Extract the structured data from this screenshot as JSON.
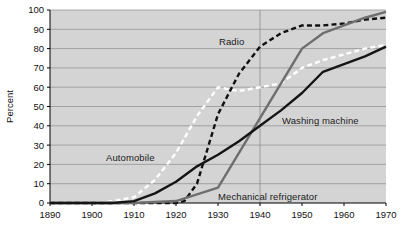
{
  "chart_data": {
    "type": "line",
    "title": "",
    "subtitle": "",
    "xlabel": "",
    "ylabel": "Percent",
    "xlim": [
      1890,
      1970
    ],
    "ylim": [
      0,
      100
    ],
    "grid": "horizontal-and-vertical",
    "legend_position": "inline-annotations",
    "plot_background": "#d4d4d4",
    "x_ticks": [
      1890,
      1900,
      1910,
      1920,
      1930,
      1940,
      1950,
      1960,
      1970
    ],
    "x_tick_labels": [
      "1890",
      "1900",
      "1910",
      "1920",
      "1930",
      "1940",
      "1950",
      "1960",
      "1970"
    ],
    "y_ticks": [
      0,
      10,
      20,
      30,
      40,
      50,
      60,
      70,
      80,
      90,
      100
    ],
    "y_tick_labels": [
      "0",
      "10",
      "20",
      "30",
      "40",
      "50",
      "60",
      "70",
      "80",
      "90",
      "100"
    ],
    "vertical_gridline_emphasis": 1940,
    "series": [
      {
        "name": "Automobile",
        "label": "Automobile",
        "color": "#ffffff",
        "style": "dashed",
        "x": [
          1890,
          1900,
          1905,
          1910,
          1915,
          1920,
          1925,
          1930,
          1935,
          1940,
          1945,
          1950,
          1955,
          1960,
          1965,
          1970
        ],
        "values": [
          0,
          0,
          1,
          3,
          12,
          26,
          45,
          60,
          58,
          60,
          62,
          70,
          74,
          77,
          80,
          82
        ]
      },
      {
        "name": "Radio",
        "label": "Radio",
        "color": "#111111",
        "style": "dashed",
        "x": [
          1890,
          1910,
          1920,
          1922,
          1925,
          1930,
          1935,
          1940,
          1945,
          1950,
          1955,
          1960,
          1965,
          1970
        ],
        "values": [
          0,
          0,
          0,
          1,
          10,
          46,
          67,
          81,
          88,
          92,
          92,
          93,
          95,
          96
        ]
      },
      {
        "name": "Mechanical refrigerator",
        "label": "Mechanical refrigerator",
        "color": "#6e6e6e",
        "style": "solid",
        "x": [
          1890,
          1910,
          1920,
          1930,
          1940,
          1945,
          1950,
          1955,
          1960,
          1965,
          1970
        ],
        "values": [
          0,
          0,
          1,
          8,
          44,
          62,
          80,
          88,
          92,
          96,
          99
        ]
      },
      {
        "name": "Washing machine",
        "label": "Washing machine",
        "color": "#151515",
        "style": "solid",
        "x": [
          1890,
          1905,
          1910,
          1915,
          1920,
          1925,
          1930,
          1935,
          1940,
          1945,
          1950,
          1955,
          1960,
          1965,
          1970
        ],
        "values": [
          0,
          0,
          1,
          5,
          11,
          19,
          25,
          32,
          40,
          48,
          57,
          68,
          72,
          76,
          81
        ]
      }
    ]
  },
  "axis": {
    "ylabel": "Percent"
  }
}
